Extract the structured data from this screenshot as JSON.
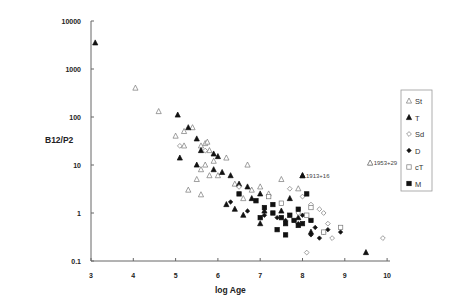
{
  "chart_data": {
    "type": "scatter",
    "title": "",
    "xlabel": "log Age",
    "ylabel": "B12/P2",
    "xlim": [
      3,
      10
    ],
    "ylim": [
      0.1,
      10000
    ],
    "yscale": "log",
    "grid": false,
    "legend_position": "right",
    "x_ticks": [
      "3",
      "4",
      "5",
      "6",
      "7",
      "8",
      "9",
      "10"
    ],
    "y_ticks": [
      "0.1",
      "1",
      "10",
      "100",
      "1000",
      "10000"
    ],
    "annotations": [
      {
        "text": "1913+16",
        "x": 8.0,
        "y": 6,
        "marker": "T"
      },
      {
        "text": "1953+29",
        "x": 9.6,
        "y": 11,
        "marker": "St"
      }
    ],
    "series": [
      {
        "name": "St",
        "marker": "triangle-open",
        "points": [
          [
            4.05,
            400
          ],
          [
            4.6,
            130
          ],
          [
            5.0,
            40
          ],
          [
            5.2,
            50
          ],
          [
            5.4,
            60
          ],
          [
            5.7,
            28
          ],
          [
            5.75,
            30
          ],
          [
            5.6,
            25
          ],
          [
            5.8,
            20
          ],
          [
            5.2,
            25
          ],
          [
            5.9,
            12
          ],
          [
            6.2,
            14
          ],
          [
            5.7,
            10
          ],
          [
            5.6,
            8
          ],
          [
            6.0,
            6
          ],
          [
            5.8,
            6
          ],
          [
            6.7,
            10
          ],
          [
            5.5,
            5
          ],
          [
            6.4,
            4
          ],
          [
            6.8,
            3
          ],
          [
            7.0,
            3.5
          ],
          [
            7.2,
            2.5
          ],
          [
            5.3,
            3
          ],
          [
            5.6,
            2.4
          ],
          [
            6.6,
            2
          ],
          [
            7.9,
            3.2
          ],
          [
            7.5,
            5
          ],
          [
            9.6,
            11
          ]
        ]
      },
      {
        "name": "T",
        "marker": "triangle-filled",
        "points": [
          [
            3.1,
            3500
          ],
          [
            5.05,
            110
          ],
          [
            5.3,
            60
          ],
          [
            5.5,
            35
          ],
          [
            5.6,
            20
          ],
          [
            5.9,
            17
          ],
          [
            6.0,
            15
          ],
          [
            5.1,
            14
          ],
          [
            5.5,
            10
          ],
          [
            5.9,
            8
          ],
          [
            6.1,
            7
          ],
          [
            6.3,
            6
          ],
          [
            6.5,
            4
          ],
          [
            6.7,
            3.5
          ],
          [
            7.0,
            2.5
          ],
          [
            6.8,
            2
          ],
          [
            6.2,
            1.5
          ],
          [
            6.4,
            1.2
          ],
          [
            7.1,
            1.1
          ],
          [
            6.6,
            0.9
          ],
          [
            7.5,
            1.1
          ],
          [
            7.0,
            0.6
          ],
          [
            7.9,
            0.8
          ],
          [
            8.0,
            6
          ],
          [
            7.7,
            2
          ],
          [
            8.2,
            0.4
          ],
          [
            9.5,
            0.15
          ]
        ]
      },
      {
        "name": "Sd",
        "marker": "diamond-open",
        "points": [
          [
            5.1,
            25
          ],
          [
            5.7,
            20
          ],
          [
            6.5,
            3.5
          ],
          [
            7.7,
            3.2
          ],
          [
            8.0,
            2.2
          ],
          [
            8.2,
            1.5
          ],
          [
            8.4,
            1.2
          ],
          [
            8.5,
            1.0
          ],
          [
            7.9,
            1.0
          ],
          [
            8.6,
            0.6
          ],
          [
            8.7,
            0.3
          ],
          [
            8.1,
            0.15
          ],
          [
            9.9,
            0.3
          ]
        ]
      },
      {
        "name": "D",
        "marker": "diamond-filled",
        "points": [
          [
            6.3,
            1.7
          ],
          [
            6.7,
            1.1
          ],
          [
            7.1,
            0.9
          ],
          [
            7.4,
            0.8
          ],
          [
            7.6,
            0.7
          ],
          [
            7.9,
            0.6
          ],
          [
            8.0,
            0.9
          ],
          [
            8.3,
            0.5
          ],
          [
            8.5,
            0.4
          ],
          [
            8.6,
            0.45
          ],
          [
            8.4,
            0.3
          ],
          [
            8.2,
            0.35
          ],
          [
            8.9,
            0.4
          ]
        ]
      },
      {
        "name": "cT",
        "marker": "square-open",
        "points": [
          [
            7.2,
            2.2
          ],
          [
            7.5,
            1.6
          ],
          [
            8.2,
            1.3
          ],
          [
            8.1,
            0.9
          ],
          [
            8.5,
            0.4
          ],
          [
            8.9,
            0.5
          ]
        ]
      },
      {
        "name": "M",
        "marker": "square-filled",
        "points": [
          [
            6.5,
            2.5
          ],
          [
            6.9,
            1.8
          ],
          [
            7.1,
            1.3
          ],
          [
            7.3,
            1.0
          ],
          [
            7.3,
            1.5
          ],
          [
            7.5,
            0.8
          ],
          [
            7.7,
            0.9
          ],
          [
            7.6,
            0.6
          ],
          [
            7.8,
            0.7
          ],
          [
            7.9,
            0.55
          ],
          [
            8.0,
            0.6
          ],
          [
            8.2,
            0.7
          ],
          [
            7.4,
            0.45
          ],
          [
            7.6,
            0.35
          ],
          [
            8.1,
            2.5
          ],
          [
            7.9,
            1.2
          ],
          [
            7.0,
            0.8
          ]
        ]
      }
    ]
  },
  "legend": {
    "items": [
      {
        "label": "St"
      },
      {
        "label": "T"
      },
      {
        "label": "Sd"
      },
      {
        "label": "D"
      },
      {
        "label": "cT"
      },
      {
        "label": "M"
      }
    ]
  }
}
